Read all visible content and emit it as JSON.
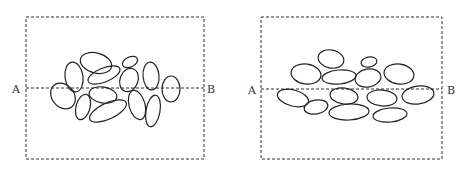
{
  "panels": [
    {
      "name": "random-fabric",
      "start_label": "A",
      "end_label": "B"
    },
    {
      "name": "oriented-fabric",
      "start_label": "A",
      "end_label": "B"
    }
  ],
  "colors": {
    "stroke": "#222222",
    "background": "#ffffff"
  }
}
